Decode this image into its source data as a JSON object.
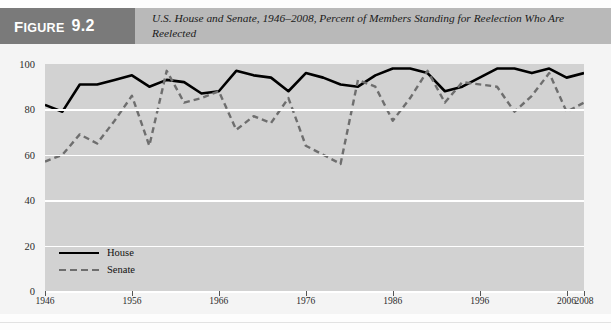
{
  "figure": {
    "badge_label_word": "IGURE",
    "badge_label_cap": "F",
    "badge_number": "9.2",
    "title": "U.S. House and Senate, 1946–2008, Percent of Members Standing for Reelection Who Are Reelected"
  },
  "colors": {
    "header_band": "#b9b9b9",
    "badge": "#7a7a7a",
    "plot_background": "#d2d2d2",
    "gridline": "#ffffff",
    "house_line": "#000000",
    "senate_line": "#6e6e6e",
    "page_background": "#f4f4f4"
  },
  "legend": {
    "position": "inside-bottom-left",
    "items": [
      {
        "label": "House",
        "style": "solid",
        "color": "#000000"
      },
      {
        "label": "Senate",
        "style": "dashed",
        "color": "#6e6e6e"
      }
    ]
  },
  "chart_data": {
    "type": "line",
    "title": "U.S. House and Senate, 1946–2008, Percent of Members Standing for Reelection Who Are Reelected",
    "xlabel": "",
    "ylabel": "",
    "xlim": [
      1946,
      2008
    ],
    "ylim": [
      0,
      100
    ],
    "grid": true,
    "ytick_labels": [
      "0",
      "20",
      "40",
      "60",
      "80",
      "100"
    ],
    "yticks": [
      0,
      20,
      40,
      60,
      80,
      100
    ],
    "xtick_labels": [
      "1946",
      "1956",
      "1966",
      "1976",
      "1986",
      "1996",
      "2006",
      "2008"
    ],
    "xticks": [
      1946,
      1956,
      1966,
      1976,
      1986,
      1996,
      2006,
      2008
    ],
    "x": [
      1946,
      1948,
      1950,
      1952,
      1954,
      1956,
      1958,
      1960,
      1962,
      1964,
      1966,
      1968,
      1970,
      1972,
      1974,
      1976,
      1978,
      1980,
      1982,
      1984,
      1986,
      1988,
      1990,
      1992,
      1994,
      1996,
      1998,
      2000,
      2002,
      2004,
      2006,
      2008
    ],
    "series": [
      {
        "name": "House",
        "style": "solid",
        "color": "#000000",
        "values": [
          82,
          79,
          91,
          91,
          93,
          95,
          90,
          93,
          92,
          87,
          88,
          97,
          95,
          94,
          88,
          96,
          94,
          91,
          90,
          95,
          98,
          98,
          96,
          88,
          90,
          94,
          98,
          98,
          96,
          98,
          94,
          96
        ]
      },
      {
        "name": "Senate",
        "style": "dashed",
        "color": "#6e6e6e",
        "values": [
          57,
          60,
          69,
          65,
          75,
          86,
          64,
          97,
          83,
          85,
          88,
          71,
          77,
          74,
          85,
          64,
          60,
          56,
          93,
          90,
          75,
          85,
          97,
          83,
          92,
          91,
          90,
          79,
          86,
          96,
          79,
          83
        ]
      }
    ]
  }
}
